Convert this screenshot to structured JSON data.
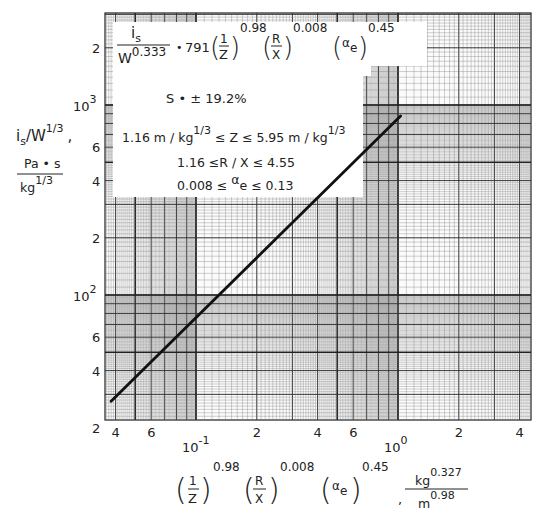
{
  "chart_data": {
    "type": "line",
    "title": "",
    "scale": "log-log",
    "xlabel": "(1/Z)^0.98 (R/X)^0.008 (α_e)^0.45 , kg^0.327 / m^0.98",
    "ylabel": "i_s/W^1/3 , Pa·s / kg^1/3",
    "xlim": [
      0.033,
      4.5
    ],
    "ylim": [
      20,
      2800
    ],
    "grid": true,
    "x_tick_labels": [
      {
        "value": 0.04,
        "label": "4"
      },
      {
        "value": 0.06,
        "label": "6"
      },
      {
        "value": 0.1,
        "label": "10",
        "exp": "-1"
      },
      {
        "value": 0.2,
        "label": "2"
      },
      {
        "value": 0.4,
        "label": "4"
      },
      {
        "value": 0.6,
        "label": "6"
      },
      {
        "value": 1,
        "label": "10",
        "exp": "0"
      },
      {
        "value": 2,
        "label": "2"
      },
      {
        "value": 4,
        "label": "4"
      }
    ],
    "y_tick_labels": [
      {
        "value": 20,
        "label": "2"
      },
      {
        "value": 40,
        "label": "4"
      },
      {
        "value": 60,
        "label": "6"
      },
      {
        "value": 100,
        "label": "10",
        "exp": "2"
      },
      {
        "value": 200,
        "label": "2"
      },
      {
        "value": 400,
        "label": "4"
      },
      {
        "value": 600,
        "label": "6"
      },
      {
        "value": 1000,
        "label": "10",
        "exp": "3"
      },
      {
        "value": 2000,
        "label": "2"
      }
    ],
    "series": [
      {
        "name": "fit",
        "x": [
          0.038,
          1.03
        ],
        "y": [
          27.6,
          875
        ],
        "color": "#111111"
      }
    ],
    "annotations": {
      "equation": {
        "lhs_num": "i",
        "lhs_num_sub": "s",
        "lhs_den": "W",
        "lhs_den_exp": "0.333",
        "eq": "•",
        "coef": "791",
        "t1_num": "1",
        "t1_den": "Z",
        "t1_exp": "0.98",
        "t2_num": "R",
        "t2_den": "X",
        "t2_exp": "0.008",
        "t3": "α",
        "t3_sub": "e",
        "t3_exp": "0.45"
      },
      "std_dev": "S  •  ± 19.2%",
      "range_z": {
        "pre": "1.16 m / kg",
        "exp1": "1/3",
        "mid": " ≤ Z ≤ 5.95 m / kg",
        "exp2": "1/3"
      },
      "range_rx": "1.16 ≤R / X ≤ 4.55",
      "range_alpha": {
        "pre": "0.008 ≤ ",
        "a": "α",
        "sub": "e",
        "post": " ≤ 0.13"
      }
    },
    "y_axis_label": {
      "top": "i",
      "top_sub": "s",
      "top_rest": "/W",
      "top_exp": "1/3",
      "comma": ",",
      "num": "Pa • s",
      "den": "kg",
      "den_exp": "1/3"
    },
    "x_axis_label": {
      "comma": ",",
      "num": "kg",
      "num_exp": "0.327",
      "den": "m",
      "den_exp": "0.98"
    }
  }
}
